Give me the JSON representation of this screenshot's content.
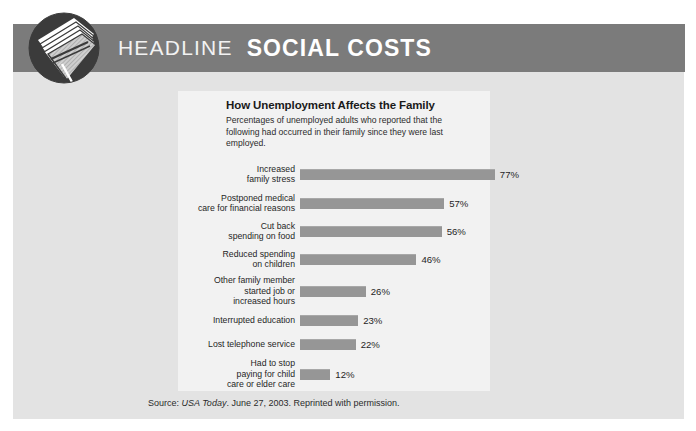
{
  "header": {
    "logo_icon": "newspaper-circle-logo",
    "kicker": "HEADLINE",
    "section": "SOCIAL COSTS",
    "banner_color": "#7b7b7b"
  },
  "panel": {
    "background": "#f2f2f2"
  },
  "source": {
    "prefix": "Source: ",
    "publication": "USA Today",
    "suffix": ". June 27, 2003. Reprinted with permission."
  },
  "chart_data": {
    "type": "bar",
    "orientation": "horizontal",
    "title": "How Unemployment Affects the Family",
    "subtitle": "Percentages of unemployed adults who reported that the following had occurred in their family since they were last employed.",
    "xlabel": "",
    "ylabel": "",
    "xlim": [
      0,
      100
    ],
    "grid": false,
    "legend": null,
    "bar_color": "#969696",
    "value_suffix": "%",
    "categories": [
      "Increased\nfamily stress",
      "Postponed medical\ncare for financial reasons",
      "Cut back\nspending on food",
      "Reduced spending\non children",
      "Other family member\nstarted job or\nincreased hours",
      "Interrupted education",
      "Lost telephone service",
      "Had to stop\npaying for child\ncare or elder care"
    ],
    "values": [
      77,
      57,
      56,
      46,
      26,
      23,
      22,
      12
    ],
    "value_labels": [
      "77%",
      "57%",
      "56%",
      "46%",
      "26%",
      "23%",
      "22%",
      "12%"
    ]
  }
}
